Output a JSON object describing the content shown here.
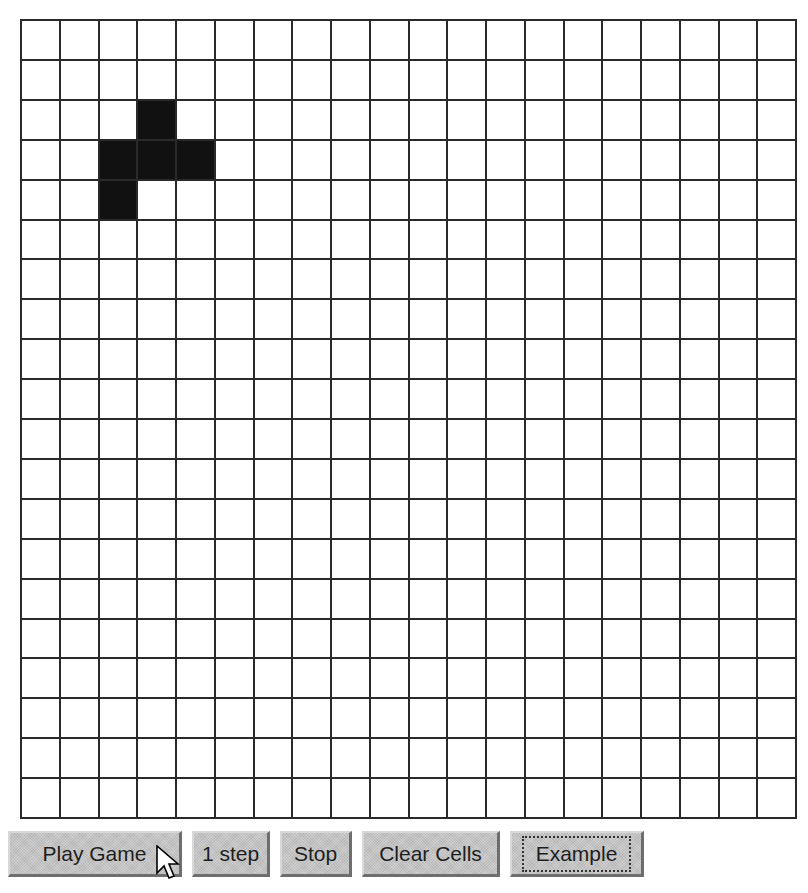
{
  "title": "The Game of Life",
  "grid": {
    "rows": 20,
    "cols": 20,
    "alive_cells": [
      [
        2,
        3
      ],
      [
        3,
        2
      ],
      [
        3,
        3
      ],
      [
        3,
        4
      ],
      [
        4,
        2
      ]
    ],
    "colors": {
      "alive": "#111111",
      "dead": "#ffffff",
      "line": "#2a2a2a"
    }
  },
  "controls": {
    "play_label": "Play Game",
    "step_label": "1 step",
    "stop_label": "Stop",
    "clear_label": "Clear Cells",
    "example_label": "Example",
    "focused": "Example"
  },
  "cursor": {
    "icon": "arrow-pointer-icon",
    "over": "Play Game"
  }
}
